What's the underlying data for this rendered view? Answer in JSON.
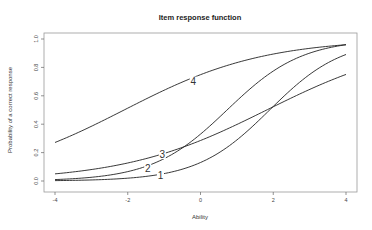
{
  "chart_data": {
    "type": "line",
    "title": "Item response function",
    "xlabel": "Ability",
    "ylabel": "Probability of a correct response",
    "xlim": [
      -4,
      4
    ],
    "ylim": [
      0,
      1
    ],
    "x_ticks": [
      -4,
      -2,
      0,
      2,
      4
    ],
    "x_tick_labels": [
      "-4",
      "-2",
      "0",
      "2",
      "4"
    ],
    "y_ticks": [
      0.0,
      0.2,
      0.4,
      0.6,
      0.8,
      1.0
    ],
    "y_tick_labels": [
      "0.0",
      "0.2",
      "0.4",
      "0.6",
      "0.8",
      "1.0"
    ],
    "grid": false,
    "legend": "none (curves labeled inline)",
    "x": [
      -4,
      -3,
      -2,
      -1,
      0,
      1,
      2,
      3,
      4
    ],
    "series": [
      {
        "name": "1",
        "model": {
          "a": 1.0,
          "b": 1.9
        },
        "values": [
          0.003,
          0.007,
          0.018,
          0.048,
          0.13,
          0.29,
          0.52,
          0.75,
          0.89
        ],
        "label_pos": {
          "x": -1.1,
          "y": 0.04
        }
      },
      {
        "name": "2",
        "model": {
          "a": 0.97,
          "b": 0.73
        },
        "values": [
          0.01,
          0.029,
          0.075,
          0.18,
          0.33,
          0.56,
          0.77,
          0.9,
          0.96
        ],
        "label_pos": {
          "x": -1.45,
          "y": 0.09
        }
      },
      {
        "name": "3",
        "model": {
          "a": 0.505,
          "b": 1.82
        },
        "values": [
          0.05,
          0.08,
          0.13,
          0.19,
          0.28,
          0.4,
          0.52,
          0.65,
          0.75
        ],
        "label_pos": {
          "x": -1.05,
          "y": 0.19
        }
      },
      {
        "name": "4",
        "model": {
          "a": 0.52,
          "b": -2.1
        },
        "values": [
          0.27,
          0.38,
          0.51,
          0.64,
          0.75,
          0.83,
          0.89,
          0.93,
          0.96
        ],
        "label_pos": {
          "x": -0.2,
          "y": 0.7
        }
      }
    ]
  },
  "layout": {
    "plot_left": 44,
    "plot_right": 357,
    "plot_top": 33,
    "plot_bottom": 192,
    "x_min_px": 55,
    "x_max_px": 346,
    "y_min_px": 181,
    "y_max_px": 39
  }
}
